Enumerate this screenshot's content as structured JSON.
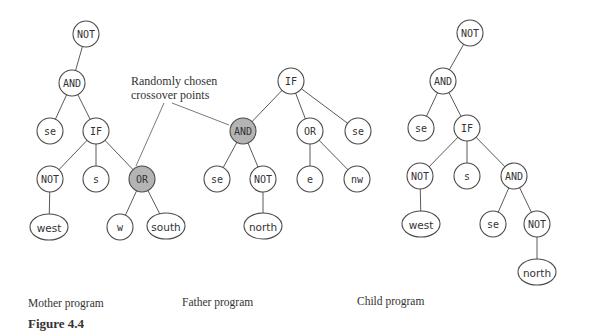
{
  "annotation": {
    "line1": "Randomly chosen",
    "line2": "crossover points"
  },
  "captions": {
    "mother": "Mother program",
    "father": "Father program",
    "child": "Child program"
  },
  "figure_label": "Figure 4.4",
  "colors": {
    "highlight_fill": "#b4b4b4",
    "stroke": "#4a4a4a",
    "text": "#333333"
  },
  "trees": {
    "mother": {
      "nodes": [
        {
          "id": "m_not",
          "label": "NOT",
          "x": 86,
          "y": 34,
          "shape": "circle"
        },
        {
          "id": "m_and",
          "label": "AND",
          "x": 72,
          "y": 83,
          "shape": "circle"
        },
        {
          "id": "m_se",
          "label": "se",
          "x": 50,
          "y": 131,
          "shape": "circle"
        },
        {
          "id": "m_if",
          "label": "IF",
          "x": 96,
          "y": 131,
          "shape": "circle"
        },
        {
          "id": "m_not2",
          "label": "NOT",
          "x": 50,
          "y": 179,
          "shape": "circle"
        },
        {
          "id": "m_s",
          "label": "s",
          "x": 96,
          "y": 179,
          "shape": "circle"
        },
        {
          "id": "m_or",
          "label": "OR",
          "x": 142,
          "y": 179,
          "shape": "circle",
          "highlight": true
        },
        {
          "id": "m_west",
          "label": "west",
          "x": 49,
          "y": 227,
          "shape": "ellipse"
        },
        {
          "id": "m_w",
          "label": "w",
          "x": 120,
          "y": 227,
          "shape": "circle"
        },
        {
          "id": "m_south",
          "label": "south",
          "x": 166,
          "y": 226,
          "shape": "ellipse"
        }
      ],
      "edges": [
        [
          "m_not",
          "m_and"
        ],
        [
          "m_and",
          "m_se"
        ],
        [
          "m_and",
          "m_if"
        ],
        [
          "m_if",
          "m_not2"
        ],
        [
          "m_if",
          "m_s"
        ],
        [
          "m_if",
          "m_or"
        ],
        [
          "m_not2",
          "m_west"
        ],
        [
          "m_or",
          "m_w"
        ],
        [
          "m_or",
          "m_south"
        ]
      ]
    },
    "father": {
      "nodes": [
        {
          "id": "f_if",
          "label": "IF",
          "x": 291,
          "y": 81,
          "shape": "circle"
        },
        {
          "id": "f_and",
          "label": "AND",
          "x": 243,
          "y": 131,
          "shape": "circle",
          "highlight": true
        },
        {
          "id": "f_or",
          "label": "OR",
          "x": 310,
          "y": 131,
          "shape": "circle"
        },
        {
          "id": "f_se",
          "label": "se",
          "x": 358,
          "y": 131,
          "shape": "circle"
        },
        {
          "id": "f_se2",
          "label": "se",
          "x": 217,
          "y": 179,
          "shape": "circle"
        },
        {
          "id": "f_not",
          "label": "NOT",
          "x": 263,
          "y": 179,
          "shape": "circle"
        },
        {
          "id": "f_e",
          "label": "e",
          "x": 310,
          "y": 179,
          "shape": "circle"
        },
        {
          "id": "f_nw",
          "label": "nw",
          "x": 357,
          "y": 179,
          "shape": "circle"
        },
        {
          "id": "f_north",
          "label": "north",
          "x": 263,
          "y": 226,
          "shape": "ellipse"
        }
      ],
      "edges": [
        [
          "f_if",
          "f_and"
        ],
        [
          "f_if",
          "f_or"
        ],
        [
          "f_if",
          "f_se"
        ],
        [
          "f_and",
          "f_se2"
        ],
        [
          "f_and",
          "f_not"
        ],
        [
          "f_or",
          "f_e"
        ],
        [
          "f_or",
          "f_nw"
        ],
        [
          "f_not",
          "f_north"
        ]
      ]
    },
    "child": {
      "nodes": [
        {
          "id": "c_not",
          "label": "NOT",
          "x": 470,
          "y": 33,
          "shape": "circle"
        },
        {
          "id": "c_and",
          "label": "AND",
          "x": 443,
          "y": 81,
          "shape": "circle"
        },
        {
          "id": "c_se",
          "label": "se",
          "x": 421,
          "y": 128,
          "shape": "circle"
        },
        {
          "id": "c_if",
          "label": "IF",
          "x": 467,
          "y": 128,
          "shape": "circle"
        },
        {
          "id": "c_not2",
          "label": "NOT",
          "x": 420,
          "y": 176,
          "shape": "circle"
        },
        {
          "id": "c_s",
          "label": "s",
          "x": 467,
          "y": 176,
          "shape": "circle"
        },
        {
          "id": "c_and2",
          "label": "AND",
          "x": 514,
          "y": 176,
          "shape": "circle"
        },
        {
          "id": "c_west",
          "label": "west",
          "x": 421,
          "y": 224,
          "shape": "ellipse"
        },
        {
          "id": "c_se2",
          "label": "se",
          "x": 493,
          "y": 224,
          "shape": "circle"
        },
        {
          "id": "c_not3",
          "label": "NOT",
          "x": 537,
          "y": 224,
          "shape": "circle"
        },
        {
          "id": "c_north",
          "label": "north",
          "x": 537,
          "y": 272,
          "shape": "ellipse"
        }
      ],
      "edges": [
        [
          "c_not",
          "c_and"
        ],
        [
          "c_and",
          "c_se"
        ],
        [
          "c_and",
          "c_if"
        ],
        [
          "c_if",
          "c_not2"
        ],
        [
          "c_if",
          "c_s"
        ],
        [
          "c_if",
          "c_and2"
        ],
        [
          "c_not2",
          "c_west"
        ],
        [
          "c_and2",
          "c_se2"
        ],
        [
          "c_and2",
          "c_not3"
        ],
        [
          "c_not3",
          "c_north"
        ]
      ]
    }
  },
  "callouts": [
    {
      "from": [
        164,
        103
      ],
      "to": [
        136,
        166
      ]
    },
    {
      "from": [
        172,
        103
      ],
      "to": [
        229,
        125
      ]
    }
  ]
}
